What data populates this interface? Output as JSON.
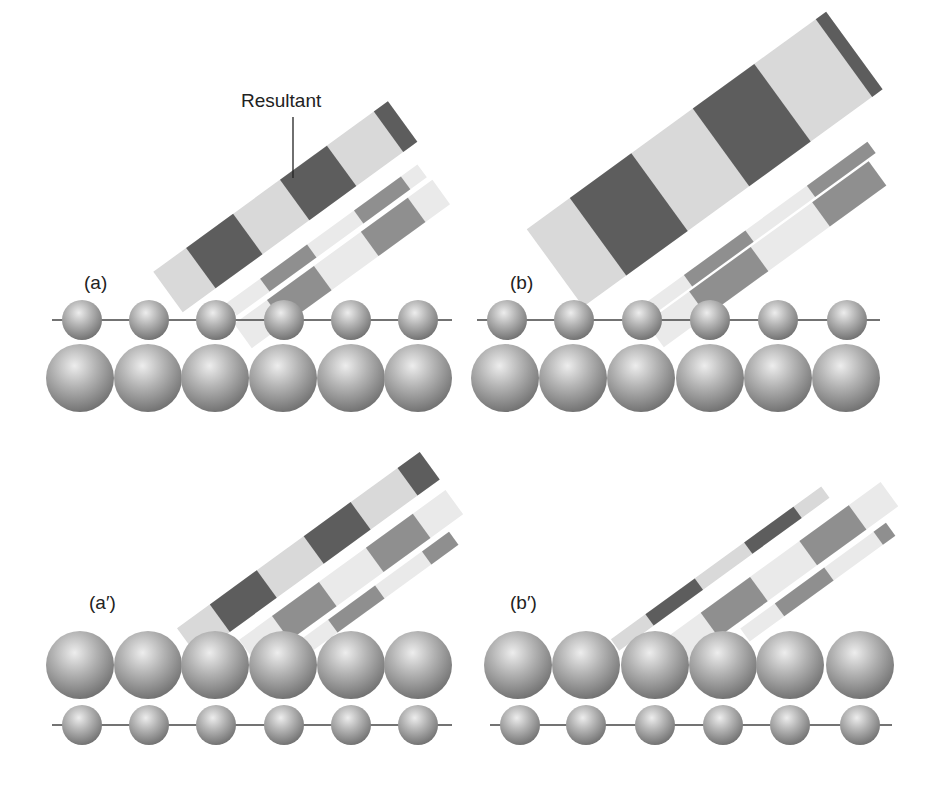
{
  "figure": {
    "annotation": "Resultant",
    "colors": {
      "background": "#ffffff",
      "band_light": "#d7d7d7",
      "band_dark": "#555555",
      "component_light": "#e9e9e9",
      "component_dark": "#8a8a8a",
      "sphere_fill": "#a9a9a9",
      "sphere_highlight": "#eeeeee",
      "sphere_shadow": "#6e6e6e",
      "line": "#444444",
      "text": "#222222"
    },
    "panels": [
      {
        "id": "a",
        "label": "(a)",
        "label_pos": [
          84,
          289
        ],
        "small_row": {
          "y": 320,
          "r": 20,
          "xs": [
            82,
            149,
            216,
            284,
            351,
            418
          ],
          "line": [
            52,
            452
          ]
        },
        "large_row": {
          "y": 378,
          "r": 34,
          "xs": [
            80,
            148,
            215,
            283,
            351,
            418
          ]
        },
        "small_on_top": true,
        "beams": {
          "angle": -36,
          "resultant": {
            "x0": 168,
            "y0": 292,
            "length": 290,
            "width": 50,
            "period": 116,
            "dark_frac": 0.5
          },
          "comp1": {
            "x0": 232,
            "y0": 309,
            "length": 235,
            "width": 16,
            "period": 116,
            "dark_frac": 0.5
          },
          "comp2": {
            "x0": 243,
            "y0": 336,
            "length": 245,
            "width": 30,
            "period": 116,
            "dark_frac": 0.5
          }
        }
      },
      {
        "id": "b",
        "label": "(b)",
        "label_pos": [
          510,
          289
        ],
        "small_row": {
          "y": 320,
          "r": 20,
          "xs": [
            507,
            574,
            642,
            710,
            778,
            847
          ],
          "line": [
            477,
            880
          ]
        },
        "large_row": {
          "y": 378,
          "r": 34,
          "xs": [
            505,
            573,
            641,
            710,
            778,
            846
          ]
        },
        "small_on_top": true,
        "beams": {
          "angle": -36,
          "resultant": {
            "x0": 555,
            "y0": 268,
            "length": 370,
            "width": 96,
            "period": 152,
            "dark_frac": 0.5
          },
          "comp1": {
            "x0": 645,
            "y0": 312,
            "length": 280,
            "width": 14,
            "period": 152,
            "dark_frac": 0.5
          },
          "comp2": {
            "x0": 655,
            "y0": 335,
            "length": 275,
            "width": 30,
            "period": 152,
            "dark_frac": 0.5
          }
        }
      },
      {
        "id": "a-prime",
        "label": "(a′)",
        "label_pos": [
          89,
          609
        ],
        "small_row": {
          "y": 725,
          "r": 20,
          "xs": [
            82,
            149,
            216,
            284,
            351,
            418
          ],
          "line": [
            52,
            452
          ]
        },
        "large_row": {
          "y": 665,
          "r": 34,
          "xs": [
            80,
            148,
            215,
            283,
            351,
            418
          ]
        },
        "small_on_top": false,
        "beams": {
          "angle": -36,
          "resultant": {
            "x0": 187,
            "y0": 642,
            "length": 300,
            "width": 34,
            "period": 116,
            "dark_frac": 0.5
          },
          "comp1": {
            "x0": 248,
            "y0": 652,
            "length": 255,
            "width": 30,
            "period": 116,
            "dark_frac": 0.5
          },
          "comp2": {
            "x0": 300,
            "y0": 650,
            "length": 190,
            "width": 16,
            "period": 116,
            "dark_frac": 0.5
          }
        }
      },
      {
        "id": "b-prime",
        "label": "(b′)",
        "label_pos": [
          510,
          609
        ],
        "small_row": {
          "y": 725,
          "r": 20,
          "xs": [
            520,
            586,
            655,
            723,
            790,
            860
          ],
          "line": [
            490,
            892
          ]
        },
        "large_row": {
          "y": 665,
          "r": 34,
          "xs": [
            518,
            586,
            655,
            723,
            790,
            860
          ]
        },
        "small_on_top": false,
        "beams": {
          "angle": -36,
          "resultant": {
            "x0": 615,
            "y0": 645,
            "length": 260,
            "width": 14,
            "period": 122,
            "dark_frac": 0.5
          },
          "comp1": {
            "x0": 675,
            "y0": 650,
            "length": 265,
            "width": 30,
            "period": 122,
            "dark_frac": 0.5
          },
          "comp2": {
            "x0": 745,
            "y0": 635,
            "length": 180,
            "width": 16,
            "period": 122,
            "dark_frac": 0.5
          }
        }
      }
    ],
    "resultant_pointer": {
      "text_pos": [
        241,
        107
      ],
      "line": [
        [
          293,
          117
        ],
        [
          293,
          178
        ]
      ]
    }
  }
}
